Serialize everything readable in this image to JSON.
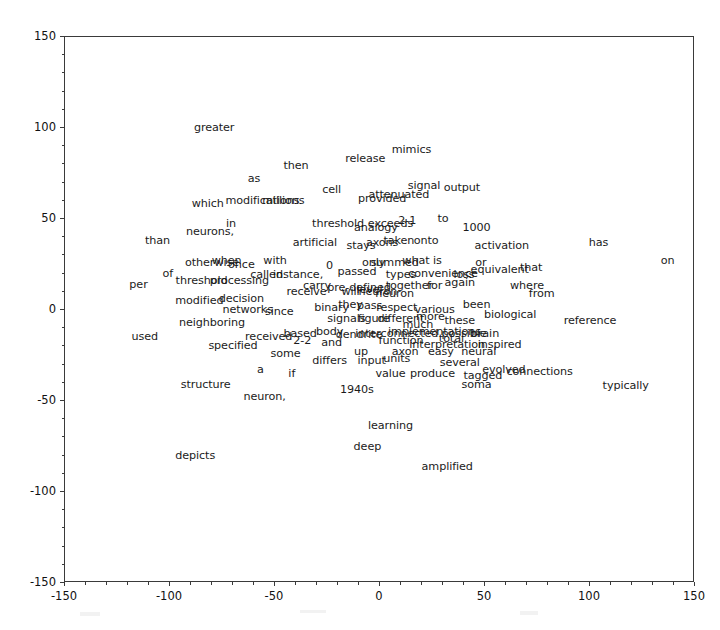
{
  "figure": {
    "type": "word-scatter",
    "background": "#ffffff",
    "axes_color": "#3a3a3a",
    "text_color": "#1b1b1b"
  },
  "chart_data": {
    "type": "scatter",
    "title": "",
    "xlabel": "",
    "ylabel": "",
    "xlim": [
      -150,
      150
    ],
    "ylim": [
      -150,
      150
    ],
    "grid": false,
    "legend": null,
    "xticks": [
      -150,
      -100,
      -50,
      0,
      50,
      100,
      150
    ],
    "yticks": [
      -150,
      -100,
      -50,
      0,
      50,
      100,
      150
    ],
    "xticklabels": [
      "-150",
      "-100",
      "-50",
      "0",
      "50",
      "100",
      "150"
    ],
    "yticklabels": [
      "-150",
      "-100",
      "-50",
      "0",
      "50",
      "100",
      "150"
    ],
    "point_labels": [
      {
        "text": "greater",
        "x": -79,
        "y": 100
      },
      {
        "text": "mimics",
        "x": 15,
        "y": 88
      },
      {
        "text": "release",
        "x": -7,
        "y": 83
      },
      {
        "text": "then",
        "x": -40,
        "y": 79
      },
      {
        "text": "as",
        "x": -60,
        "y": 72
      },
      {
        "text": "output",
        "x": 39,
        "y": 67
      },
      {
        "text": "signal",
        "x": 21,
        "y": 68
      },
      {
        "text": "cell",
        "x": -23,
        "y": 66
      },
      {
        "text": "attenuated",
        "x": 9,
        "y": 63
      },
      {
        "text": "provided",
        "x": 1,
        "y": 61
      },
      {
        "text": "modifications",
        "x": -56,
        "y": 60
      },
      {
        "text": "millions",
        "x": -46,
        "y": 60
      },
      {
        "text": "which",
        "x": -82,
        "y": 58
      },
      {
        "text": "to",
        "x": 30,
        "y": 50
      },
      {
        "text": "2-1",
        "x": 13,
        "y": 49
      },
      {
        "text": "exceeds",
        "x": 5,
        "y": 47
      },
      {
        "text": "analogy",
        "x": -2,
        "y": 45
      },
      {
        "text": "threshold",
        "x": -20,
        "y": 47
      },
      {
        "text": "1000",
        "x": 46,
        "y": 45
      },
      {
        "text": "in",
        "x": -71,
        "y": 47
      },
      {
        "text": "neurons,",
        "x": -81,
        "y": 43
      },
      {
        "text": "onto",
        "x": 22,
        "y": 38
      },
      {
        "text": "taken",
        "x": 9,
        "y": 38
      },
      {
        "text": "axons",
        "x": 1,
        "y": 37
      },
      {
        "text": "stays",
        "x": -9,
        "y": 35
      },
      {
        "text": "artificial",
        "x": -31,
        "y": 37
      },
      {
        "text": "than",
        "x": -106,
        "y": 38
      },
      {
        "text": "activation",
        "x": 58,
        "y": 35
      },
      {
        "text": "has",
        "x": 104,
        "y": 37
      },
      {
        "text": "on",
        "x": 137,
        "y": 27
      },
      {
        "text": "what is",
        "x": 20,
        "y": 27
      },
      {
        "text": "summed",
        "x": 7,
        "y": 26
      },
      {
        "text": "only",
        "x": -3,
        "y": 26
      },
      {
        "text": "with",
        "x": -50,
        "y": 27
      },
      {
        "text": "once",
        "x": -66,
        "y": 25
      },
      {
        "text": "when",
        "x": -73,
        "y": 27
      },
      {
        "text": "otherwise",
        "x": -80,
        "y": 26
      },
      {
        "text": "that",
        "x": 72,
        "y": 23
      },
      {
        "text": "equivalent",
        "x": 57,
        "y": 22
      },
      {
        "text": "or",
        "x": 48,
        "y": 26
      },
      {
        "text": "loss",
        "x": 40,
        "y": 19
      },
      {
        "text": "convenience",
        "x": 30,
        "y": 20
      },
      {
        "text": "types",
        "x": 10,
        "y": 19
      },
      {
        "text": "passed",
        "x": -11,
        "y": 21
      },
      {
        "text": "0",
        "x": -24,
        "y": 24
      },
      {
        "text": "instance,",
        "x": -39,
        "y": 19
      },
      {
        "text": "called",
        "x": -54,
        "y": 19
      },
      {
        "text": "processing",
        "x": -67,
        "y": 16
      },
      {
        "text": "threshold",
        "x": -85,
        "y": 16
      },
      {
        "text": "of",
        "x": -101,
        "y": 20
      },
      {
        "text": "per",
        "x": -115,
        "y": 14
      },
      {
        "text": "where",
        "x": 70,
        "y": 13
      },
      {
        "text": "from",
        "x": 77,
        "y": 9
      },
      {
        "text": "again",
        "x": 38,
        "y": 15
      },
      {
        "text": "for",
        "x": 26,
        "y": 13
      },
      {
        "text": "together",
        "x": 14,
        "y": 13
      },
      {
        "text": "neuron",
        "x": 7,
        "y": 9
      },
      {
        "text": "neuron",
        "x": -1,
        "y": 10
      },
      {
        "text": "level",
        "x": -5,
        "y": 11
      },
      {
        "text": "will",
        "x": -14,
        "y": 10
      },
      {
        "text": "pre-defined",
        "x": -10,
        "y": 12
      },
      {
        "text": "carry",
        "x": -30,
        "y": 13
      },
      {
        "text": "receive",
        "x": -35,
        "y": 10
      },
      {
        "text": "decision",
        "x": -66,
        "y": 6
      },
      {
        "text": "modified",
        "x": -86,
        "y": 5
      },
      {
        "text": "been",
        "x": 46,
        "y": 3
      },
      {
        "text": "various",
        "x": 26,
        "y": 0
      },
      {
        "text": "respect",
        "x": 8,
        "y": 1
      },
      {
        "text": "pass",
        "x": -5,
        "y": 2
      },
      {
        "text": "they",
        "x": -14,
        "y": 3
      },
      {
        "text": "binary",
        "x": -23,
        "y": 1
      },
      {
        "text": "since",
        "x": -48,
        "y": -1
      },
      {
        "text": "networks",
        "x": -63,
        "y": 0
      },
      {
        "text": "biological",
        "x": 62,
        "y": -3
      },
      {
        "text": "reference",
        "x": 100,
        "y": -6
      },
      {
        "text": "these",
        "x": 38,
        "y": -6
      },
      {
        "text": "more",
        "x": 24,
        "y": -4
      },
      {
        "text": "much",
        "x": 18,
        "y": -8
      },
      {
        "text": "different",
        "x": 10,
        "y": -5
      },
      {
        "text": "figure",
        "x": -3,
        "y": -5
      },
      {
        "text": "signals",
        "x": -16,
        "y": -5
      },
      {
        "text": "neighboring",
        "x": -80,
        "y": -7
      },
      {
        "text": "brain",
        "x": 50,
        "y": -13
      },
      {
        "text": "possible",
        "x": 40,
        "y": -13
      },
      {
        "text": "implementations",
        "x": 26,
        "y": -12
      },
      {
        "text": "interconnected",
        "x": 8,
        "y": -13
      },
      {
        "text": "dendrite",
        "x": -10,
        "y": -14
      },
      {
        "text": "body",
        "x": -24,
        "y": -12
      },
      {
        "text": "based",
        "x": -38,
        "y": -13
      },
      {
        "text": "received",
        "x": -53,
        "y": -15
      },
      {
        "text": "used",
        "x": -112,
        "y": -15
      },
      {
        "text": "inspired",
        "x": 57,
        "y": -19
      },
      {
        "text": "interpretation",
        "x": 32,
        "y": -19
      },
      {
        "text": "total",
        "x": 34,
        "y": -16
      },
      {
        "text": "function",
        "x": 10,
        "y": -17
      },
      {
        "text": "and",
        "x": -23,
        "y": -18
      },
      {
        "text": "2-2",
        "x": -37,
        "y": -17
      },
      {
        "text": "specified",
        "x": -70,
        "y": -20
      },
      {
        "text": "neural",
        "x": 47,
        "y": -23
      },
      {
        "text": "easy",
        "x": 29,
        "y": -23
      },
      {
        "text": "axon",
        "x": 12,
        "y": -23
      },
      {
        "text": "up",
        "x": -9,
        "y": -23
      },
      {
        "text": "some",
        "x": -45,
        "y": -24
      },
      {
        "text": "several",
        "x": 38,
        "y": -29
      },
      {
        "text": "units",
        "x": 8,
        "y": -27
      },
      {
        "text": "input",
        "x": -4,
        "y": -28
      },
      {
        "text": "differs",
        "x": -24,
        "y": -28
      },
      {
        "text": "connections",
        "x": 76,
        "y": -34
      },
      {
        "text": "evolved",
        "x": 59,
        "y": -33
      },
      {
        "text": "tagged",
        "x": 49,
        "y": -36
      },
      {
        "text": "produce",
        "x": 25,
        "y": -35
      },
      {
        "text": "value",
        "x": 5,
        "y": -35
      },
      {
        "text": "if",
        "x": -42,
        "y": -35
      },
      {
        "text": "a",
        "x": -57,
        "y": -33
      },
      {
        "text": "typically",
        "x": 117,
        "y": -42
      },
      {
        "text": "soma",
        "x": 46,
        "y": -41
      },
      {
        "text": "1940s",
        "x": -11,
        "y": -44
      },
      {
        "text": "structure",
        "x": -83,
        "y": -41
      },
      {
        "text": "neuron,",
        "x": -55,
        "y": -48
      },
      {
        "text": "learning",
        "x": 5,
        "y": -64
      },
      {
        "text": "deep",
        "x": -6,
        "y": -75
      },
      {
        "text": "depicts",
        "x": -88,
        "y": -80
      },
      {
        "text": "amplified",
        "x": 32,
        "y": -86
      }
    ]
  }
}
